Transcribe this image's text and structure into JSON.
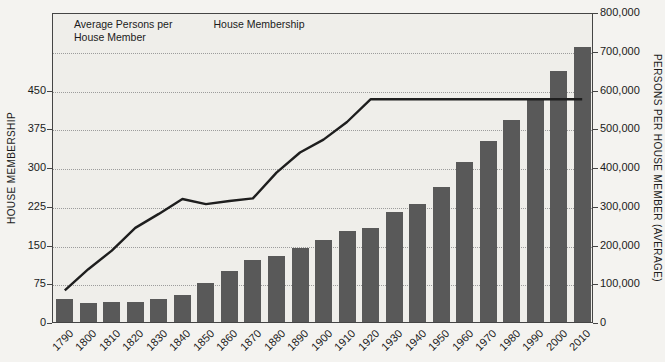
{
  "colors": {
    "bar": "#595959",
    "line": "#1e1e1e",
    "plot_bg": "#efeeea",
    "page_bg": "#f4f3f0",
    "grid": "#9c9c9c",
    "axis": "#454545"
  },
  "legend": {
    "bar_item": {
      "line1": "Average Persons per",
      "line2": "House Member"
    },
    "line_item": {
      "label": "House Membership"
    }
  },
  "chart_data": {
    "type": "bar",
    "title": "",
    "categories": [
      "1790",
      "1800",
      "1810",
      "1820",
      "1830",
      "1840",
      "1850",
      "1860",
      "1870",
      "1880",
      "1890",
      "1900",
      "1910",
      "1920",
      "1930",
      "1940",
      "1950",
      "1960",
      "1970",
      "1980",
      "1990",
      "2000",
      "2010"
    ],
    "series": [
      {
        "name": "Average Persons per House Member",
        "type": "bar",
        "axis": "right",
        "color": "#595959",
        "values": [
          60000,
          50000,
          51000,
          52000,
          60000,
          71000,
          100000,
          132000,
          159000,
          171000,
          190000,
          213000,
          236000,
          244000,
          283000,
          304000,
          348000,
          412000,
          467000,
          521000,
          572000,
          647000,
          710000
        ]
      },
      {
        "name": "House Membership",
        "type": "line",
        "axis": "left",
        "color": "#1e1e1e",
        "values": [
          65,
          106,
          142,
          186,
          213,
          242,
          232,
          238,
          243,
          293,
          332,
          357,
          391,
          435,
          435,
          435,
          435,
          435,
          435,
          435,
          435,
          435,
          435
        ]
      }
    ],
    "left_axis": {
      "label": "HOUSE MEMBERSHIP",
      "ticks": [
        0,
        75,
        150,
        225,
        300,
        375,
        450
      ],
      "grid_values": [
        75,
        150,
        225,
        300,
        375,
        450,
        525
      ],
      "scale_max": 600
    },
    "right_axis": {
      "label": "PERSONS PER HOUSE MEMBER (AVERAGE)",
      "tick_labels": [
        "0",
        "100,000",
        "200,000",
        "300,000",
        "400,000",
        "500,000",
        "600,000",
        "700,000",
        "800,000"
      ],
      "scale_max": 800000
    },
    "grid": "dotted",
    "legend_position": "top-left-inside"
  }
}
